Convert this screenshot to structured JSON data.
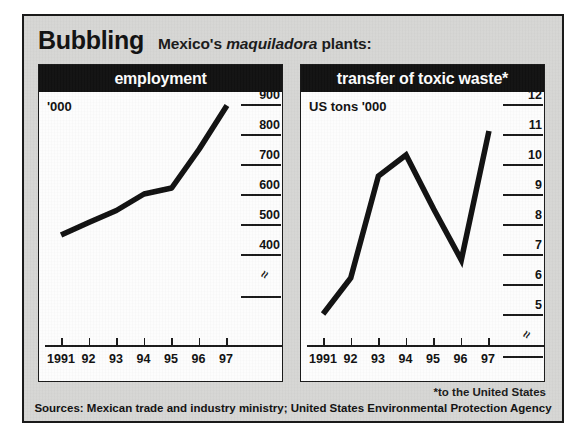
{
  "header": {
    "kicker": "Bubbling",
    "subtitle_pre": "Mexico's ",
    "subtitle_italic": "maquiladora",
    "subtitle_post": " plants:"
  },
  "footnote": "*to the United States",
  "sources": "Sources: Mexican trade and industry ministry; United States Environmental Protection Agency",
  "colors": {
    "panel_header_bg": "#111111",
    "panel_header_text": "#ffffff",
    "figure_bg": "#d8d8d6",
    "line": "#111111",
    "frame": "#1a1a1a"
  },
  "chart_data": [
    {
      "type": "line",
      "title": "employment",
      "ylabel": "'000",
      "xlabel": "",
      "grid": false,
      "legend": "none",
      "axis_break": true,
      "categories": [
        "1991",
        "92",
        "93",
        "94",
        "95",
        "96",
        "97"
      ],
      "yticks": [
        900,
        800,
        700,
        600,
        500,
        400
      ],
      "ylim": [
        380,
        920
      ],
      "values": [
        463,
        505,
        545,
        600,
        620,
        750,
        895
      ]
    },
    {
      "type": "line",
      "title": "transfer of toxic waste*",
      "ylabel": "US tons '000",
      "xlabel": "",
      "grid": false,
      "legend": "none",
      "axis_break": true,
      "categories": [
        "1991",
        "92",
        "93",
        "94",
        "95",
        "96",
        "97"
      ],
      "yticks": [
        12,
        11,
        10,
        9,
        8,
        7,
        6,
        5
      ],
      "ylim": [
        4.4,
        12.4
      ],
      "values": [
        5.0,
        6.2,
        9.6,
        10.3,
        8.5,
        6.8,
        11.1
      ]
    }
  ]
}
